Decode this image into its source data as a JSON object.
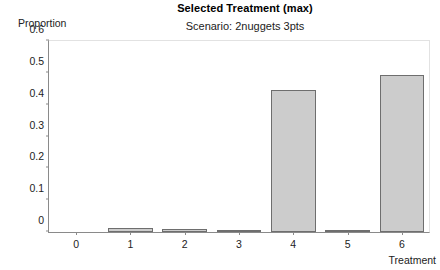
{
  "chart_data": {
    "type": "bar",
    "title": "Selected Treatment (max)",
    "subtitle": "Scenario: 2nuggets 3pts",
    "xlabel": "Treatment",
    "ylabel": "Proportion",
    "categories": [
      "0",
      "1",
      "2",
      "3",
      "4",
      "5",
      "6"
    ],
    "values": [
      0,
      0.013,
      0.008,
      0.006,
      0.447,
      0.007,
      0.492
    ],
    "ylim": [
      0,
      0.6
    ],
    "yticks": [
      "0",
      "0.1",
      "0.2",
      "0.3",
      "0.4",
      "0.5",
      "0.6"
    ],
    "ytick_values": [
      0,
      0.1,
      0.2,
      0.3,
      0.4,
      0.5,
      0.6
    ],
    "grid": false,
    "legend": null,
    "bar_fill_color": "#cccccc",
    "bar_border_color": "#6e6e6e",
    "axis_color": "#8a8a8a"
  }
}
